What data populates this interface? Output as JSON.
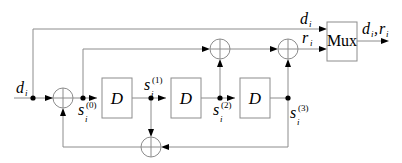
{
  "diagram": {
    "type": "block-diagram",
    "input": {
      "symbol": "d",
      "subscript": "i"
    },
    "delays": [
      {
        "label": "D"
      },
      {
        "label": "D"
      },
      {
        "label": "D"
      }
    ],
    "states": [
      {
        "symbol": "s",
        "subscript": "i",
        "superscript": "(0)"
      },
      {
        "symbol": "s",
        "subscript": "i",
        "superscript": "(1)"
      },
      {
        "symbol": "s",
        "subscript": "i",
        "superscript": "(2)"
      },
      {
        "symbol": "s",
        "subscript": "i",
        "superscript": "(3)"
      }
    ],
    "systematic_output": {
      "symbol": "d",
      "subscript": "i"
    },
    "parity_output": {
      "symbol": "r",
      "subscript": "i"
    },
    "mux": {
      "label": "Mux"
    },
    "mux_output": {
      "symbol1": "d",
      "sub1": "i",
      "sep": ",",
      "symbol2": "r",
      "sub2": "i"
    },
    "adders": 4,
    "colors": {
      "wire": "#8c8c8c",
      "arrow": "#000000",
      "dot": "#000000"
    }
  }
}
